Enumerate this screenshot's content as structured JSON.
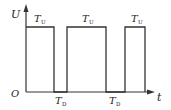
{
  "diagram": {
    "type": "pulse-waveform",
    "axes": {
      "y_label": "U",
      "x_label": "t",
      "origin_label": "O"
    },
    "high_intervals": [
      {
        "label_main": "T",
        "label_sub": "U"
      },
      {
        "label_main": "T",
        "label_sub": "U"
      },
      {
        "label_main": "T",
        "label_sub": "U"
      }
    ],
    "low_intervals": [
      {
        "label_main": "T",
        "label_sub": "D"
      },
      {
        "label_main": "T",
        "label_sub": "D"
      }
    ],
    "colors": {
      "line": "#333333",
      "text": "#222222",
      "background": "#ffffff"
    }
  }
}
